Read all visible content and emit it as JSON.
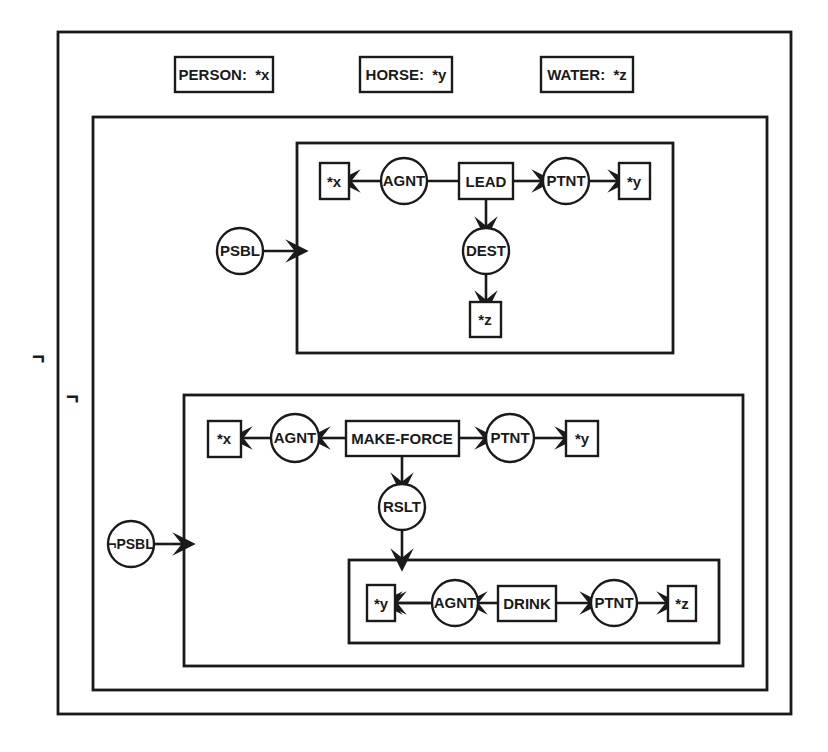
{
  "diagram": {
    "type": "conceptual-graph",
    "outer_negation": "¬",
    "inner_negation": "¬",
    "types": [
      {
        "label": "PERSON:  *x"
      },
      {
        "label": "HORSE:  *y"
      },
      {
        "label": "WATER:  *z"
      }
    ],
    "upper_context": {
      "modal": "PSBL",
      "concept": "LEAD",
      "agent_relation": "AGNT",
      "agent": "*x",
      "patient_relation": "PTNT",
      "patient": "*y",
      "dest_relation": "DEST",
      "dest": "*z"
    },
    "lower_context": {
      "modal": "¬PSBL",
      "concept": "MAKE-FORCE",
      "agent_relation": "AGNT",
      "agent": "*x",
      "patient_relation": "PTNT",
      "patient": "*y",
      "result_relation": "RSLT",
      "result_context": {
        "concept": "DRINK",
        "agent_relation": "AGNT",
        "agent": "*y",
        "patient_relation": "PTNT",
        "patient": "*z"
      }
    }
  }
}
